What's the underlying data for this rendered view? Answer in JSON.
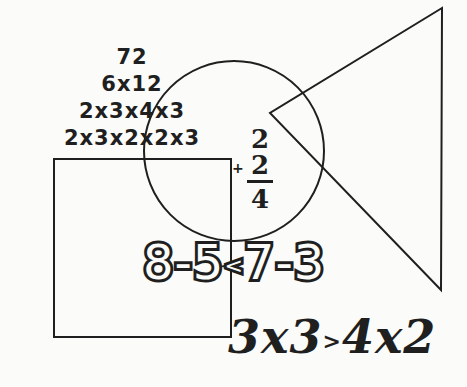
{
  "factor_tree": {
    "lines": [
      "72",
      "6x12",
      "2x3x4x3",
      "2x3x2x2x3"
    ]
  },
  "fraction_sum": {
    "plus": "+",
    "numerator": "2",
    "middle": "2",
    "denominator": "4"
  },
  "comparison_1": {
    "left": "8-5",
    "operator": "<",
    "right": "7-3"
  },
  "comparison_2": {
    "left": "3x3",
    "operator": ">",
    "right": "4x2"
  },
  "shapes": {
    "square": {
      "x": 54,
      "y": 159,
      "w": 177,
      "h": 178
    },
    "circle": {
      "cx": 234,
      "cy": 151,
      "r": 90
    },
    "triangle": {
      "points": "442,8 270,113 441,290"
    },
    "stroke_color": "#1f1f1f"
  }
}
